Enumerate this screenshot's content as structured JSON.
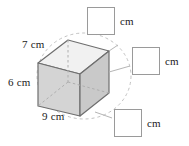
{
  "figure": {
    "type": "rectangular-prism",
    "caption_unit": "cm",
    "dimensions": [
      {
        "name": "depth",
        "value": "7 cm"
      },
      {
        "name": "height",
        "value": "6 cm"
      },
      {
        "name": "width",
        "value": "9 cm"
      }
    ],
    "colors": {
      "top_face": "#f0f0f0",
      "front_face": "#d6d6d6",
      "side_face": "#cfcfcf",
      "edge": "#6e6e6e",
      "hidden_edge": "#b0b0b0",
      "guide_circle": "#c0c0c0",
      "text": "#1a1a1a",
      "box_border": "#9a9a9a",
      "background": "#ffffff"
    }
  },
  "answers": {
    "top": {
      "value": "",
      "placeholder": "",
      "unit": "cm"
    },
    "right": {
      "value": "",
      "placeholder": "",
      "unit": "cm"
    },
    "bottom": {
      "value": "",
      "placeholder": "",
      "unit": "cm"
    }
  }
}
